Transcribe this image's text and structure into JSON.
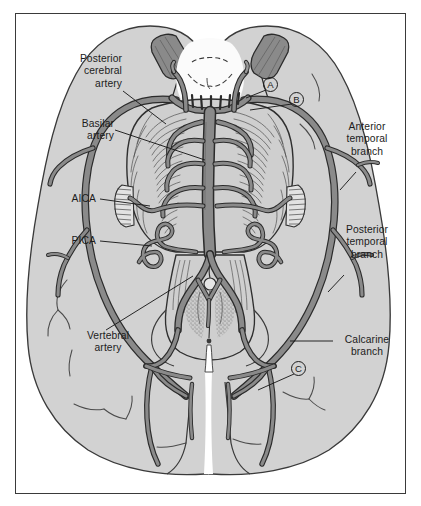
{
  "figure": {
    "frame_border_color": "#3a3a3a",
    "background_color": "#ffffff",
    "brain_fill_color": "#d2d2d2",
    "artery_fill_color": "#8a8a8a",
    "artery_outline_color": "#2b2b2b",
    "brainstem_fill_color": "#cfcfcf",
    "leader_line_color": "#1c1c1c",
    "text_color": "#1c1c1c"
  },
  "labels": {
    "posterior_cerebral_artery": "Posterior\ncerebral\nartery",
    "basilar_artery": "Basilar\nartery",
    "aica": "AICA",
    "pica": "PICA",
    "vertebral_artery": "Vertebral\nartery",
    "anterior_temporal_branch": "Anterior\ntemporal\nbranch",
    "posterior_temporal_branch": "Posterior\ntemporal\nbranch",
    "calcarine_branch": "Calcarine\nbranch"
  },
  "callouts": [
    {
      "id": "A",
      "label": "A"
    },
    {
      "id": "B",
      "label": "B"
    },
    {
      "id": "C",
      "label": "C"
    }
  ],
  "anatomy": {
    "structures": [
      "cerebral hemispheres",
      "temporal lobes",
      "occipital lobes",
      "midbrain",
      "pons",
      "medulla oblongata",
      "cerebellum",
      "olivary nuclei",
      "mammillary bodies",
      "internal carotid artery stumps"
    ],
    "arteries": [
      "basilar artery",
      "posterior cerebral artery",
      "vertebral artery",
      "anterior inferior cerebellar artery (AICA)",
      "posterior inferior cerebellar artery (PICA)",
      "anterior temporal branch",
      "posterior temporal branch",
      "calcarine branch",
      "pontine arteries",
      "superior cerebellar artery",
      "posterior communicating artery"
    ]
  }
}
